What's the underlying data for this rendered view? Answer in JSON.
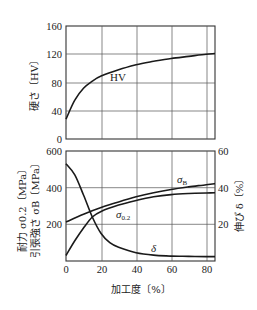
{
  "chart_data": [
    {
      "type": "line",
      "title": "",
      "xlabel": "",
      "ylabel": "硬さ〔HV〕",
      "xlim": [
        0,
        85
      ],
      "ylim": [
        0,
        160
      ],
      "xticks": [
        0,
        20,
        40,
        60,
        80
      ],
      "yticks": [
        0,
        40,
        80,
        120,
        160
      ],
      "grid": true,
      "series": [
        {
          "name": "HV",
          "x": [
            0,
            5,
            10,
            15,
            20,
            30,
            40,
            50,
            60,
            70,
            80,
            85
          ],
          "values": [
            28,
            55,
            72,
            82,
            89,
            98,
            105,
            110,
            114,
            117,
            120,
            121
          ]
        }
      ]
    },
    {
      "type": "line",
      "title": "",
      "xlabel": "加工度〔%〕",
      "ylabel": "耐力 σ0.2〔MPa〕 引張強さ σB〔MPa〕",
      "ylabel_right": "伸び δ〔%〕",
      "xlim": [
        0,
        85
      ],
      "ylim": [
        0,
        600
      ],
      "ylim_right": [
        0,
        60
      ],
      "xticks": [
        0,
        20,
        40,
        60,
        80
      ],
      "yticks": [
        200,
        400,
        600
      ],
      "yticks_right": [
        20,
        40,
        60
      ],
      "grid": true,
      "series": [
        {
          "name": "σB",
          "axis": "left",
          "x": [
            0,
            10,
            20,
            30,
            40,
            50,
            60,
            70,
            80,
            85
          ],
          "values": [
            212,
            255,
            292,
            322,
            350,
            372,
            390,
            404,
            416,
            422
          ]
        },
        {
          "name": "σ0.2",
          "axis": "left",
          "x": [
            0,
            5,
            10,
            15,
            20,
            30,
            40,
            50,
            60,
            70,
            80,
            85
          ],
          "values": [
            30,
            110,
            180,
            240,
            270,
            305,
            330,
            350,
            362,
            368,
            371,
            372
          ]
        },
        {
          "name": "δ",
          "axis": "right",
          "x": [
            0,
            5,
            10,
            15,
            20,
            25,
            30,
            40,
            50,
            60,
            70,
            80,
            85
          ],
          "values": [
            53,
            47,
            36,
            24,
            15,
            10,
            7.5,
            4.5,
            3.2,
            2.7,
            2.5,
            2.4,
            2.4
          ]
        }
      ]
    }
  ],
  "labels": {
    "top_ylabel": "硬さ〔HV〕",
    "bottom_ylabel_line1": "耐力 σ0.2〔MPa〕",
    "bottom_ylabel_line2": "引張強さ σB〔MPa〕",
    "right_ylabel": "伸び δ〔%〕",
    "xlabel": "加工度〔%〕",
    "hv_label": "HV",
    "sb_label": "σ",
    "sb_sub": "B",
    "s02_label": "σ",
    "s02_sub": "0.2",
    "delta_label": "δ"
  },
  "ticks": {
    "x": [
      "0",
      "20",
      "40",
      "60",
      "80"
    ],
    "top_y": [
      "160",
      "120",
      "80",
      "40",
      "0"
    ],
    "bottom_y": [
      "600",
      "400",
      "200"
    ],
    "right_y": [
      "60",
      "40",
      "20"
    ]
  }
}
